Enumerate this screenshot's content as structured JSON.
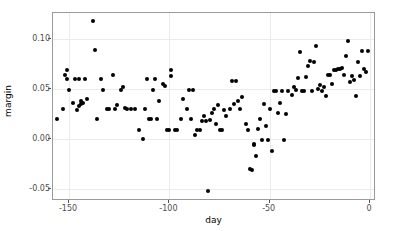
{
  "chart_data": {
    "type": "scatter",
    "title": "",
    "xlabel": "day",
    "ylabel": "margin",
    "xlim": [
      -158,
      3
    ],
    "ylim": [
      -0.062,
      0.126
    ],
    "xticks": [
      -150,
      -100,
      -50,
      0
    ],
    "xtick_labels": [
      "-150",
      "-100",
      "-50",
      "0"
    ],
    "yticks": [
      -0.05,
      0.0,
      0.05,
      0.1
    ],
    "ytick_labels": [
      "-0.05",
      "0.00",
      "0.05",
      "0.10"
    ],
    "grid": true,
    "grid_color": "#ebebeb",
    "panel_border_color": "#9a9a9a",
    "point_color": "#000000",
    "point_size": 4,
    "series": [
      {
        "name": "margin",
        "points": [
          [
            -156,
            0.02
          ],
          [
            -153,
            0.03
          ],
          [
            -152,
            0.064
          ],
          [
            -151,
            0.069
          ],
          [
            -151,
            0.06
          ],
          [
            -150,
            0.049
          ],
          [
            -148,
            0.036
          ],
          [
            -147,
            0.06
          ],
          [
            -146,
            0.029
          ],
          [
            -145,
            0.033
          ],
          [
            -145,
            0.06
          ],
          [
            -144,
            0.038
          ],
          [
            -144,
            0.035
          ],
          [
            -143,
            0.036
          ],
          [
            -142,
            0.06
          ],
          [
            -141,
            0.04
          ],
          [
            -138,
            0.118
          ],
          [
            -137,
            0.089
          ],
          [
            -136,
            0.02
          ],
          [
            -134,
            0.06
          ],
          [
            -133,
            0.049
          ],
          [
            -131,
            0.03
          ],
          [
            -130,
            0.03
          ],
          [
            -128,
            0.064
          ],
          [
            -127,
            0.03
          ],
          [
            -126,
            0.034
          ],
          [
            -124,
            0.049
          ],
          [
            -123,
            0.052
          ],
          [
            -122,
            0.031
          ],
          [
            -121,
            0.03
          ],
          [
            -119,
            0.03
          ],
          [
            -117,
            0.03
          ],
          [
            -115,
            0.009
          ],
          [
            -113,
            0.0
          ],
          [
            -112,
            0.03
          ],
          [
            -111,
            0.06
          ],
          [
            -110,
            0.02
          ],
          [
            -109,
            0.02
          ],
          [
            -108,
            0.049
          ],
          [
            -107,
            0.06
          ],
          [
            -106,
            0.02
          ],
          [
            -105,
            0.038
          ],
          [
            -103,
            0.055
          ],
          [
            -102,
            0.053
          ],
          [
            -101,
            0.009
          ],
          [
            -100,
            0.009
          ],
          [
            -99,
            0.063
          ],
          [
            -99,
            0.069
          ],
          [
            -97,
            0.009
          ],
          [
            -96,
            0.009
          ],
          [
            -94,
            0.02
          ],
          [
            -93,
            0.04
          ],
          [
            -91,
            0.03
          ],
          [
            -90,
            0.049
          ],
          [
            -89,
            0.02
          ],
          [
            -88,
            0.049
          ],
          [
            -87,
            0.004
          ],
          [
            -86,
            0.009
          ],
          [
            -85,
            0.009
          ],
          [
            -84,
            0.018
          ],
          [
            -83,
            0.023
          ],
          [
            -82,
            0.018
          ],
          [
            -81,
            -0.052
          ],
          [
            -80,
            0.019
          ],
          [
            -79,
            0.026
          ],
          [
            -78,
            0.03
          ],
          [
            -77,
            0.015
          ],
          [
            -76,
            0.034
          ],
          [
            -75,
            0.009
          ],
          [
            -74,
            0.009
          ],
          [
            -73,
            0.029
          ],
          [
            -72,
            0.023
          ],
          [
            -70,
            0.03
          ],
          [
            -69,
            0.058
          ],
          [
            -68,
            0.035
          ],
          [
            -67,
            0.058
          ],
          [
            -66,
            0.038
          ],
          [
            -65,
            0.03
          ],
          [
            -64,
            0.042
          ],
          [
            -62,
            0.015
          ],
          [
            -61,
            0.009
          ],
          [
            -60,
            -0.03
          ],
          [
            -59,
            -0.031
          ],
          [
            -58,
            -0.006
          ],
          [
            -58,
            -0.005
          ],
          [
            -57,
            -0.017
          ],
          [
            -56,
            0.01
          ],
          [
            -55,
            0.02
          ],
          [
            -54,
            -0.001
          ],
          [
            -53,
            0.035
          ],
          [
            -52,
            0.013
          ],
          [
            -51,
            -0.001
          ],
          [
            -50,
            0.03
          ],
          [
            -49,
            -0.012
          ],
          [
            -48,
            0.048
          ],
          [
            -47,
            0.048
          ],
          [
            -46,
            0.026
          ],
          [
            -45,
            0.036
          ],
          [
            -44,
            0.048
          ],
          [
            -43,
            -0.001
          ],
          [
            -42,
            0.025
          ],
          [
            -41,
            0.048
          ],
          [
            -39,
            0.044
          ],
          [
            -38,
            0.052
          ],
          [
            -37,
            0.049
          ],
          [
            -36,
            0.061
          ],
          [
            -35,
            0.087
          ],
          [
            -34,
            0.048
          ],
          [
            -33,
            0.048
          ],
          [
            -32,
            0.062
          ],
          [
            -31,
            0.073
          ],
          [
            -30,
            0.078
          ],
          [
            -29,
            0.048
          ],
          [
            -28,
            0.077
          ],
          [
            -27,
            0.093
          ],
          [
            -26,
            0.05
          ],
          [
            -25,
            0.054
          ],
          [
            -24,
            0.048
          ],
          [
            -23,
            0.052
          ],
          [
            -22,
            0.043
          ],
          [
            -21,
            0.064
          ],
          [
            -20,
            0.064
          ],
          [
            -19,
            0.055
          ],
          [
            -18,
            0.069
          ],
          [
            -17,
            0.069
          ],
          [
            -16,
            0.07
          ],
          [
            -15,
            0.07
          ],
          [
            -14,
            0.071
          ],
          [
            -13,
            0.064
          ],
          [
            -12,
            0.083
          ],
          [
            -11,
            0.098
          ],
          [
            -10,
            0.057
          ],
          [
            -9,
            0.063
          ],
          [
            -8,
            0.059
          ],
          [
            -7,
            0.043
          ],
          [
            -6,
            0.077
          ],
          [
            -5,
            0.063
          ],
          [
            -4,
            0.088
          ],
          [
            -3,
            0.07
          ],
          [
            -2,
            0.067
          ],
          [
            -1,
            0.088
          ]
        ]
      }
    ]
  }
}
